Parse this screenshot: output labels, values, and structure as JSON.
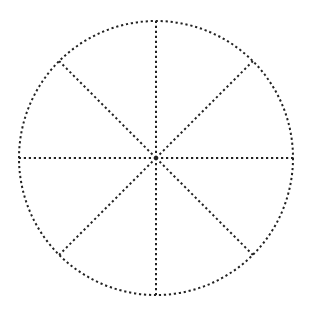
{
  "diagram": {
    "type": "circle-divided-into-sectors",
    "sectors": 8,
    "line_style": "dotted",
    "stroke_color": "#222222",
    "background": "#ffffff",
    "center": [
      156,
      158
    ],
    "radius": 137,
    "spokes": [
      {
        "angle_deg": 0
      },
      {
        "angle_deg": 45
      },
      {
        "angle_deg": 90
      },
      {
        "angle_deg": 135
      },
      {
        "angle_deg": 180
      },
      {
        "angle_deg": 225
      },
      {
        "angle_deg": 270
      },
      {
        "angle_deg": 315
      }
    ]
  }
}
